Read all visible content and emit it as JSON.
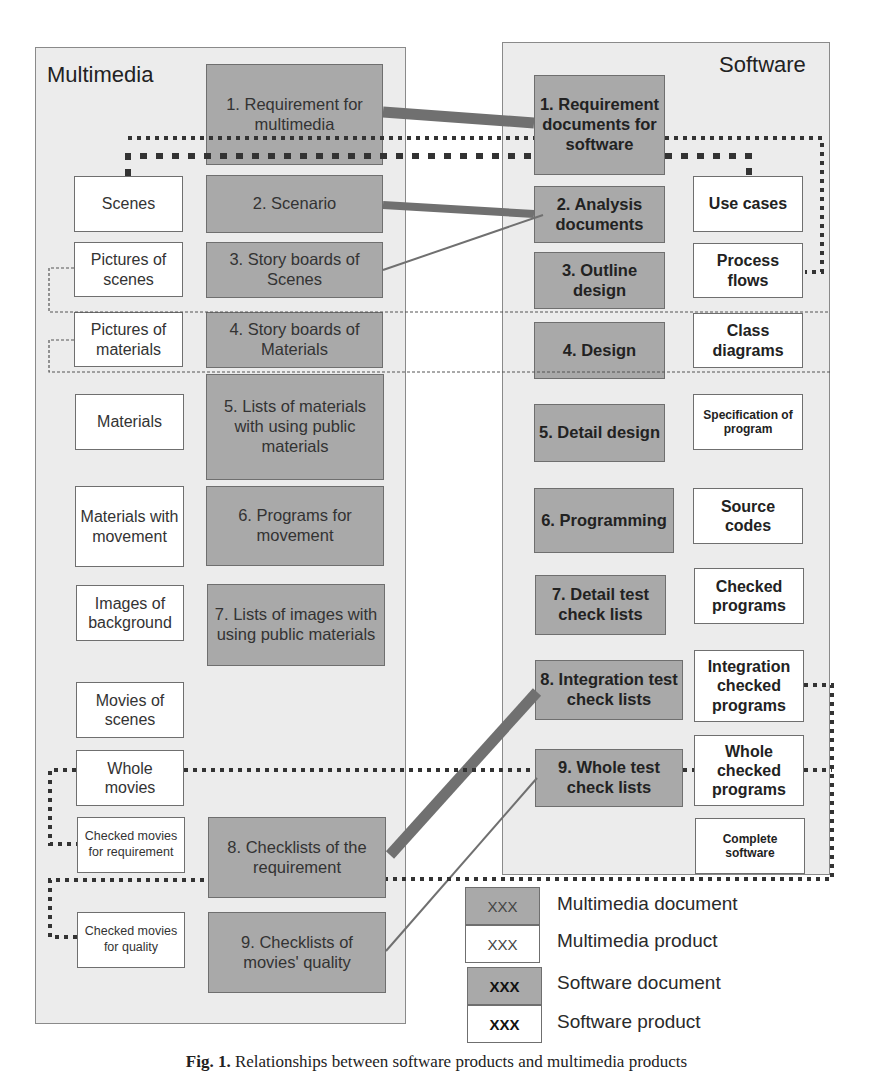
{
  "multimedia": {
    "title": "Multimedia",
    "documents": [
      {
        "label": "1. Requirement for multimedia"
      },
      {
        "label": "2. Scenario"
      },
      {
        "label": "3. Story boards of Scenes"
      },
      {
        "label": "4. Story boards of Materials"
      },
      {
        "label": "5. Lists of materials with using public materials"
      },
      {
        "label": "6. Programs for movement"
      },
      {
        "label": "7. Lists of images with using public materials"
      },
      {
        "label": "8. Checklists of the requirement"
      },
      {
        "label": "9. Checklists of movies' quality"
      }
    ],
    "products": [
      {
        "label": "Scenes"
      },
      {
        "label": "Pictures of scenes"
      },
      {
        "label": "Pictures of materials"
      },
      {
        "label": "Materials"
      },
      {
        "label": "Materials with movement"
      },
      {
        "label": "Images of background"
      },
      {
        "label": "Movies of scenes"
      },
      {
        "label": "Whole movies"
      },
      {
        "label": "Checked movies for requirement"
      },
      {
        "label": "Checked movies for quality"
      }
    ]
  },
  "software": {
    "title": "Software",
    "documents": [
      {
        "label": "1. Requirement documents for software"
      },
      {
        "label": "2. Analysis documents"
      },
      {
        "label": "3. Outline design"
      },
      {
        "label": "4. Design"
      },
      {
        "label": "5. Detail design"
      },
      {
        "label": "6. Programming"
      },
      {
        "label": "7. Detail test check lists"
      },
      {
        "label": "8. Integration test check lists"
      },
      {
        "label": "9. Whole test check lists"
      }
    ],
    "products": [
      {
        "label": "Use cases"
      },
      {
        "label": "Process flows"
      },
      {
        "label": "Class diagrams"
      },
      {
        "label": "Specification of program"
      },
      {
        "label": "Source codes"
      },
      {
        "label": "Checked programs"
      },
      {
        "label": "Integration checked programs"
      },
      {
        "label": "Whole checked programs"
      },
      {
        "label": "Complete software"
      }
    ]
  },
  "legend": {
    "items": [
      {
        "swatch": "XXX",
        "label": "Multimedia document",
        "fill": "#a9a9a9"
      },
      {
        "swatch": "XXX",
        "label": "Multimedia product",
        "fill": "#ffffff"
      },
      {
        "swatch": "XXX",
        "label": "Software document",
        "fill": "#a9a9a9"
      },
      {
        "swatch": "XXX",
        "label": "Software product",
        "fill": "#ffffff"
      }
    ]
  },
  "colors": {
    "panel_bg": "#ececec",
    "document_fill": "#a9a9a9",
    "product_fill": "#ffffff",
    "connector": "#707070",
    "dotted": "#333333"
  },
  "caption": {
    "prefix": "Fig. 1.",
    "text": "Relationships between software products and multimedia products"
  }
}
